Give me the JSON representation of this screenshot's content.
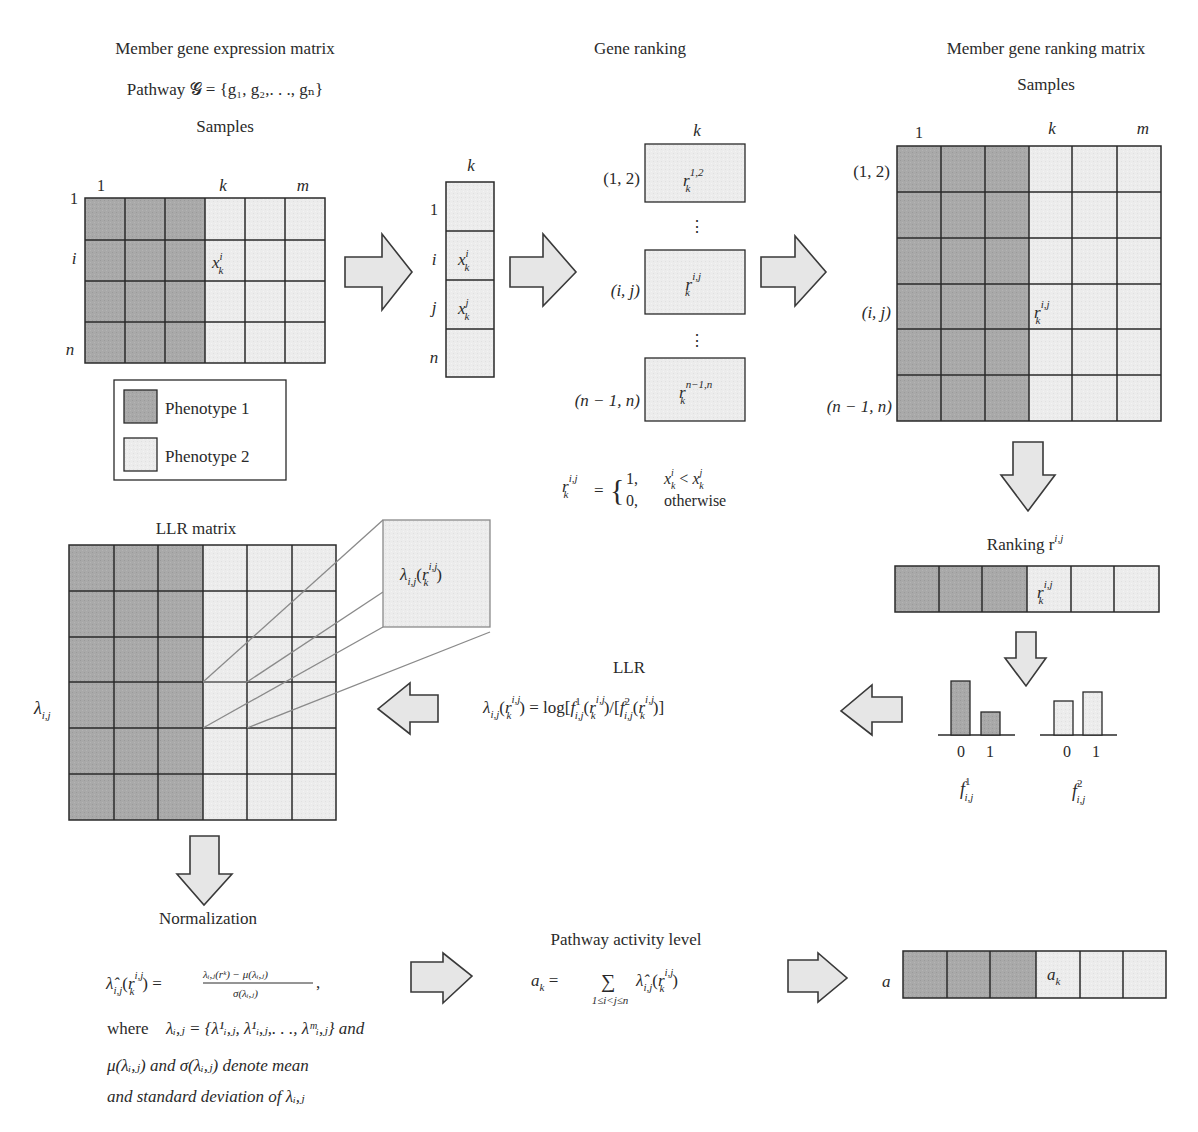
{
  "colors": {
    "phenotype1": "#a6a6a6",
    "phenotype2": "#ececec",
    "line": "#2a2a2a",
    "arrow_fill": "#e6e6e6"
  },
  "expression": {
    "title": "Member gene expression matrix",
    "pathway": "Pathway 𝓖 = {g₁, g₂,. . ., gₙ}",
    "samples_label": "Samples",
    "col_labels": [
      "1",
      "k",
      "m"
    ],
    "row_labels": [
      "1",
      "i",
      "n"
    ],
    "cell_label": "x",
    "cell_sup": "i",
    "cell_sub": "k"
  },
  "legend": {
    "items": [
      {
        "label": "Phenotype 1"
      },
      {
        "label": "Phenotype 2"
      }
    ]
  },
  "column_vector": {
    "header": "k",
    "row_labels": [
      "1",
      "i",
      "j",
      "n"
    ],
    "cells": [
      {
        "sup": "i",
        "sub": "k"
      },
      {
        "sup": "j",
        "sub": "k"
      }
    ]
  },
  "gene_ranking": {
    "title": "Gene ranking",
    "header": "k",
    "rows": [
      {
        "label": "(1, 2)",
        "sup": "1,2"
      },
      {
        "label": "(i, j)",
        "sup": "i,j"
      },
      {
        "label": "(n − 1, n)",
        "sup": "n−1,n"
      }
    ],
    "ellipsis": "⋮",
    "rule_lhs": "r",
    "rule_lhs_sup": "i,j",
    "rule_lhs_sub": "k",
    "rule_case1_value": "1,",
    "rule_case1_cond": "xᵢₖ < xʲₖ",
    "rule_case0_value": "0,",
    "rule_case0_cond": "otherwise"
  },
  "ranking_matrix": {
    "title": "Member gene ranking matrix",
    "samples_label": "Samples",
    "col_labels": [
      "1",
      "k",
      "m"
    ],
    "row_labels": [
      "(1, 2)",
      "(i, j)",
      "(n − 1, n)"
    ],
    "cell_sup": "i,j",
    "cell_sub": "k"
  },
  "ranking_vector": {
    "title": "Ranking r",
    "title_sup": "i,j",
    "cell_sup": "i,j",
    "cell_sub": "k"
  },
  "distributions": {
    "f1": {
      "label": "f",
      "sup": "1",
      "sub": "i,j",
      "ticks": [
        "0",
        "1"
      ],
      "values": [
        0.85,
        0.4
      ]
    },
    "f2": {
      "label": "f",
      "sup": "2",
      "sub": "i,j",
      "ticks": [
        "0",
        "1"
      ],
      "values": [
        0.55,
        0.65
      ]
    }
  },
  "llr": {
    "title": "LLR",
    "formula": "λᵢ,ⱼ(rᵏ) = log[f¹ᵢ,ⱼ(rᵏ)/[f²ᵢ,ⱼ(rᵏ)]"
  },
  "llr_matrix": {
    "title": "LLR matrix",
    "row_label": "λ",
    "row_label_sub": "i,j",
    "callout": "λ",
    "callout_sub": "i,j"
  },
  "normalization": {
    "title": "Normalization",
    "where_text": "where",
    "set_def": "λᵢ,ⱼ = {λ¹ᵢ,ⱼ, λ¹ᵢ,ⱼ,. . ., λᵐᵢ,ⱼ} and",
    "line3": "μ(λᵢ,ⱼ) and σ(λᵢ,ⱼ) denote mean",
    "line4": "and standard deviation of λᵢ,ⱼ",
    "numerator": "λᵢ,ⱼ(rᵏ) − μ(λᵢ,ⱼ)",
    "denominator": "σ(λᵢ,ⱼ)"
  },
  "activity": {
    "title": "Pathway activity level",
    "lhs": "a",
    "lhs_sub": "k",
    "sum_range": "1≤i<j≤n",
    "vector_label": "a",
    "cell_label": "a",
    "cell_sub": "k"
  }
}
